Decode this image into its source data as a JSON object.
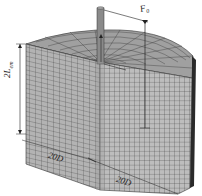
{
  "figure": {
    "type": "finite-element mesh of pile in cylindrical soil domain",
    "labels": {
      "force": "F",
      "force_sub": "0",
      "height": "2L",
      "height_sub": "em",
      "width_left": "20D",
      "width_right": "20D"
    },
    "colors": {
      "mesh_face": "#b8b8b8",
      "mesh_top": "#9a9a9a",
      "mesh_lines": "#3a3a3a",
      "pile": "#8a8a8a",
      "edge_dark": "#2a2a2a",
      "background": "#ffffff"
    }
  }
}
